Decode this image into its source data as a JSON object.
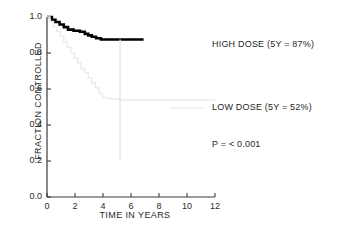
{
  "chart_data": {
    "type": "line",
    "title": "",
    "subtitle": "",
    "xlabel": "TIME IN YEARS",
    "ylabel": "FRACTION CONTROLLED",
    "xlim": [
      0,
      12
    ],
    "ylim": [
      0.0,
      1.0
    ],
    "xticks": [
      "0",
      "2",
      "4",
      "6",
      "8",
      "10",
      "12"
    ],
    "xtick_values": [
      0,
      2,
      4,
      6,
      8,
      10,
      12
    ],
    "yticks": [
      "0.0",
      "0.2",
      "0.4",
      "0.6",
      "0.8",
      "1.0"
    ],
    "ytick_values": [
      0.0,
      0.2,
      0.4,
      0.6,
      0.8,
      1.0
    ],
    "grid": false,
    "legend_position": "right-inside-plot-area",
    "style": "kaplan-meier-step",
    "series": [
      {
        "name": "HIGH DOSE",
        "color": "#000000",
        "line_width": 2.6,
        "five_year_rate": "87%",
        "step_points": [
          [
            0.0,
            1.0
          ],
          [
            0.35,
            1.0
          ],
          [
            0.35,
            0.985
          ],
          [
            0.6,
            0.985
          ],
          [
            0.6,
            0.972
          ],
          [
            0.9,
            0.972
          ],
          [
            0.9,
            0.958
          ],
          [
            1.2,
            0.958
          ],
          [
            1.2,
            0.944
          ],
          [
            1.5,
            0.944
          ],
          [
            1.5,
            0.93
          ],
          [
            1.9,
            0.93
          ],
          [
            1.9,
            0.924
          ],
          [
            2.35,
            0.924
          ],
          [
            2.35,
            0.918
          ],
          [
            2.7,
            0.918
          ],
          [
            2.7,
            0.906
          ],
          [
            2.95,
            0.906
          ],
          [
            2.95,
            0.898
          ],
          [
            3.2,
            0.898
          ],
          [
            3.2,
            0.89
          ],
          [
            3.5,
            0.89
          ],
          [
            3.5,
            0.882
          ],
          [
            3.85,
            0.882
          ],
          [
            3.85,
            0.875
          ],
          [
            6.9,
            0.875
          ]
        ]
      },
      {
        "name": "LOW DOSE",
        "color": "#eeeeee",
        "line_width": 1.7,
        "five_year_rate": "52%",
        "step_points": [
          [
            0.0,
            1.0
          ],
          [
            0.2,
            1.0
          ],
          [
            0.2,
            0.975
          ],
          [
            0.45,
            0.975
          ],
          [
            0.45,
            0.948
          ],
          [
            0.7,
            0.948
          ],
          [
            0.7,
            0.92
          ],
          [
            0.95,
            0.92
          ],
          [
            0.95,
            0.892
          ],
          [
            1.2,
            0.892
          ],
          [
            1.2,
            0.862
          ],
          [
            1.45,
            0.862
          ],
          [
            1.45,
            0.832
          ],
          [
            1.7,
            0.832
          ],
          [
            1.7,
            0.8
          ],
          [
            1.95,
            0.8
          ],
          [
            1.95,
            0.772
          ],
          [
            2.2,
            0.772
          ],
          [
            2.2,
            0.742
          ],
          [
            2.45,
            0.742
          ],
          [
            2.45,
            0.712
          ],
          [
            2.7,
            0.712
          ],
          [
            2.7,
            0.69
          ],
          [
            2.95,
            0.69
          ],
          [
            2.95,
            0.662
          ],
          [
            3.2,
            0.662
          ],
          [
            3.2,
            0.634
          ],
          [
            3.45,
            0.634
          ],
          [
            3.45,
            0.606
          ],
          [
            3.7,
            0.606
          ],
          [
            3.7,
            0.575
          ],
          [
            3.95,
            0.575
          ],
          [
            3.95,
            0.552
          ],
          [
            4.4,
            0.552
          ],
          [
            4.4,
            0.545
          ],
          [
            5.3,
            0.545
          ],
          [
            5.3,
            0.538
          ],
          [
            12.0,
            0.538
          ]
        ]
      }
    ],
    "reference_line": {
      "name": "five-year-marker",
      "x": 5.22,
      "y_top": 0.875,
      "y_bottom": 0.205,
      "color": "#e2e2e2",
      "line_width": 1.3
    },
    "annotations": [
      {
        "id": "high-dose-label",
        "text": "HIGH DOSE (5Y = 87%)",
        "x_px": 212,
        "y_px": 39
      },
      {
        "id": "low-dose-label",
        "text": "LOW DOSE (5Y = 52%)",
        "x_px": 212,
        "y_px": 102
      },
      {
        "id": "p-value-label",
        "text": "P = < 0.001",
        "x_px": 212,
        "y_px": 139
      }
    ],
    "legend_swatch": {
      "name": "low-dose-swatch-line",
      "color": "#eeeeee",
      "x1_px": 170,
      "x2_px": 205,
      "y_px": 108
    },
    "axis_color": "#3a3a3a"
  }
}
